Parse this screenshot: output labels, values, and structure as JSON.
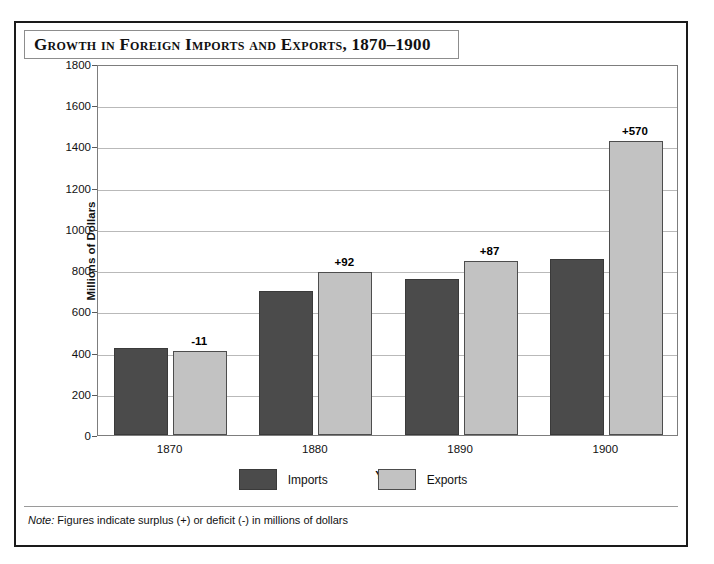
{
  "figure": {
    "title": "Growth in Foreign Imports and Exports, 1870–1900",
    "note_prefix": "Note:",
    "note_body": " Figures indicate surplus (+) or deficit (-) in millions of dollars"
  },
  "colors": {
    "imports": "#4b4b4b",
    "exports": "#c2c2c2",
    "gridline": "#b9b9b9",
    "frame": "#7d7d7d",
    "outer_border": "#1a1a1a"
  },
  "chart_data": {
    "type": "bar",
    "title": "Growth in Foreign Imports and Exports, 1870–1900",
    "xlabel": "Year",
    "ylabel": "Millions of Dollars",
    "categories": [
      "1870",
      "1880",
      "1890",
      "1900"
    ],
    "ylim": [
      0,
      1800
    ],
    "yticks": [
      0,
      200,
      400,
      600,
      800,
      1000,
      1200,
      1400,
      1600,
      1800
    ],
    "ytick_labels": [
      "0",
      "200",
      "400",
      "600",
      "800",
      "1000",
      "1200",
      "1400",
      "1600",
      "1800"
    ],
    "grid": true,
    "legend_position": "bottom-center",
    "series": [
      {
        "name": "Imports",
        "values": [
          420,
          700,
          755,
          855
        ]
      },
      {
        "name": "Exports",
        "values": [
          409,
          792,
          842,
          1425
        ]
      }
    ],
    "annotations": [
      "-11",
      "+92",
      "+87",
      "+570"
    ],
    "annotation_meaning": "surplus (+) or deficit (-) in millions of dollars"
  }
}
